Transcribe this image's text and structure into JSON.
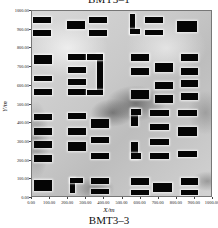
{
  "header": {
    "title_top": "BMT3–1"
  },
  "footer": {
    "title_bottom": "BMT3–3"
  },
  "axes": {
    "xlabel": "X/m",
    "ylabel": "Y/m",
    "xticks": [
      "0.00",
      "100.00",
      "200.00",
      "300.00",
      "400.00",
      "500.00",
      "600.00",
      "700.00",
      "800.00",
      "900.00",
      "1000.00"
    ],
    "yticks": [
      "0.00",
      "100.00",
      "200.00",
      "300.00",
      "400.00",
      "500.00",
      "600.00",
      "700.00",
      "800.00",
      "900.00",
      "1000.00"
    ]
  },
  "chart_data": {
    "type": "heatmap",
    "title": "BMT3–3",
    "xlabel": "X/m",
    "ylabel": "Y/m",
    "xlim": [
      0,
      1000
    ],
    "ylim": [
      0,
      1000
    ],
    "x_ticks": [
      0,
      100,
      200,
      300,
      400,
      500,
      600,
      700,
      800,
      900,
      1000
    ],
    "y_ticks": [
      0,
      100,
      200,
      300,
      400,
      500,
      600,
      700,
      800,
      900,
      1000
    ],
    "grid": false,
    "colormap": "grayscale (light = high, dark = low)",
    "buildings_m": [
      [
        5,
        935,
        105,
        965
      ],
      [
        5,
        865,
        105,
        900
      ],
      [
        195,
        905,
        295,
        945
      ],
      [
        320,
        935,
        420,
        965
      ],
      [
        320,
        865,
        420,
        900
      ],
      [
        550,
        875,
        575,
        985
      ],
      [
        550,
        875,
        605,
        905
      ],
      [
        630,
        935,
        730,
        965
      ],
      [
        630,
        870,
        730,
        900
      ],
      [
        810,
        885,
        920,
        945
      ],
      [
        10,
        715,
        110,
        760
      ],
      [
        10,
        620,
        110,
        650
      ],
      [
        10,
        545,
        110,
        580
      ],
      [
        200,
        735,
        300,
        765
      ],
      [
        200,
        665,
        300,
        700
      ],
      [
        200,
        600,
        300,
        635
      ],
      [
        200,
        545,
        300,
        580
      ],
      [
        365,
        565,
        395,
        765
      ],
      [
        305,
        735,
        395,
        765
      ],
      [
        305,
        545,
        395,
        575
      ],
      [
        555,
        730,
        655,
        765
      ],
      [
        555,
        655,
        655,
        690
      ],
      [
        555,
        525,
        655,
        575
      ],
      [
        685,
        670,
        790,
        720
      ],
      [
        685,
        580,
        790,
        615
      ],
      [
        685,
        505,
        790,
        545
      ],
      [
        830,
        730,
        930,
        765
      ],
      [
        830,
        655,
        930,
        690
      ],
      [
        830,
        590,
        930,
        625
      ],
      [
        830,
        520,
        930,
        555
      ],
      [
        10,
        410,
        110,
        445
      ],
      [
        10,
        330,
        110,
        365
      ],
      [
        10,
        260,
        110,
        295
      ],
      [
        10,
        185,
        110,
        220
      ],
      [
        200,
        415,
        300,
        450
      ],
      [
        200,
        330,
        300,
        365
      ],
      [
        200,
        245,
        300,
        290
      ],
      [
        330,
        370,
        430,
        415
      ],
      [
        330,
        285,
        430,
        320
      ],
      [
        330,
        200,
        430,
        235
      ],
      [
        10,
        25,
        110,
        85
      ],
      [
        210,
        15,
        240,
        100
      ],
      [
        210,
        70,
        285,
        100
      ],
      [
        330,
        65,
        430,
        95
      ],
      [
        330,
        10,
        430,
        40
      ],
      [
        555,
        380,
        590,
        470
      ],
      [
        555,
        440,
        610,
        470
      ],
      [
        555,
        200,
        590,
        290
      ],
      [
        555,
        200,
        610,
        230
      ],
      [
        660,
        430,
        765,
        465
      ],
      [
        660,
        355,
        765,
        390
      ],
      [
        660,
        275,
        765,
        310
      ],
      [
        660,
        200,
        765,
        235
      ],
      [
        815,
        430,
        920,
        465
      ],
      [
        815,
        325,
        920,
        375
      ],
      [
        815,
        210,
        920,
        245
      ],
      [
        555,
        60,
        655,
        95
      ],
      [
        555,
        5,
        655,
        35
      ],
      [
        675,
        20,
        780,
        70
      ],
      [
        830,
        60,
        930,
        95
      ],
      [
        830,
        5,
        930,
        35
      ]
    ]
  }
}
